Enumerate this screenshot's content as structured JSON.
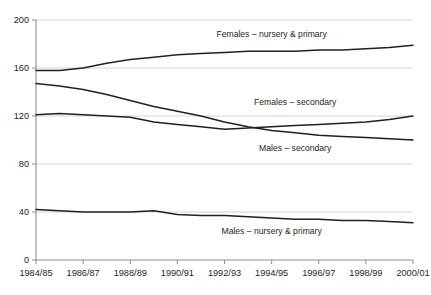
{
  "chart_data": {
    "type": "line",
    "title": "",
    "subtitle": "",
    "xlabel": "",
    "ylabel": "",
    "xlim": [
      "1984/85",
      "2000/01"
    ],
    "ylim": [
      0,
      200
    ],
    "grid": true,
    "grid_axis": "y",
    "legend_position": "inline-annotations",
    "y_ticks": [
      0,
      40,
      80,
      120,
      160,
      200
    ],
    "y_tick_labels": [
      "0",
      "40",
      "80",
      "120",
      "160",
      "200"
    ],
    "x_tick_labels": [
      "1984/85",
      "1986/87",
      "1988/89",
      "1990/91",
      "1992/93",
      "1994/95",
      "1996/97",
      "1998/99",
      "2000/01"
    ],
    "x": [
      "1984/85",
      "1985/86",
      "1986/87",
      "1987/88",
      "1988/89",
      "1989/90",
      "1990/91",
      "1991/92",
      "1992/93",
      "1993/94",
      "1994/95",
      "1995/96",
      "1996/97",
      "1997/98",
      "1998/99",
      "1999/00",
      "2000/01"
    ],
    "series": [
      {
        "name": "Females – nursery & primary",
        "color": "#231f20",
        "values": [
          158,
          158,
          160,
          164,
          167,
          169,
          171,
          172,
          173,
          174,
          174,
          174,
          175,
          175,
          176,
          177,
          179
        ],
        "label_x": "1994/95",
        "label_value": 186
      },
      {
        "name": "Females – secondary",
        "color": "#231f20",
        "values": [
          121,
          122,
          121,
          120,
          119,
          115,
          113,
          111,
          109,
          110,
          111,
          112,
          113,
          114,
          115,
          117,
          120
        ],
        "label_x": "1995/96",
        "label_value": 129
      },
      {
        "name": "Males – secondary",
        "color": "#231f20",
        "values": [
          147,
          145,
          142,
          138,
          133,
          128,
          124,
          120,
          115,
          111,
          108,
          106,
          104,
          103,
          102,
          101,
          100
        ],
        "label_x": "1995/96",
        "label_value": 91
      },
      {
        "name": "Males – nursery & primary",
        "color": "#231f20",
        "values": [
          42,
          41,
          40,
          40,
          40,
          41,
          38,
          37,
          37,
          36,
          35,
          34,
          34,
          33,
          33,
          32,
          31
        ],
        "label_x": "1994/95",
        "label_value": 22
      }
    ],
    "colors": {
      "line": "#231f20",
      "grid": "#cfcfcf",
      "axis": "#8d8d8d",
      "background": "#ffffff"
    }
  }
}
